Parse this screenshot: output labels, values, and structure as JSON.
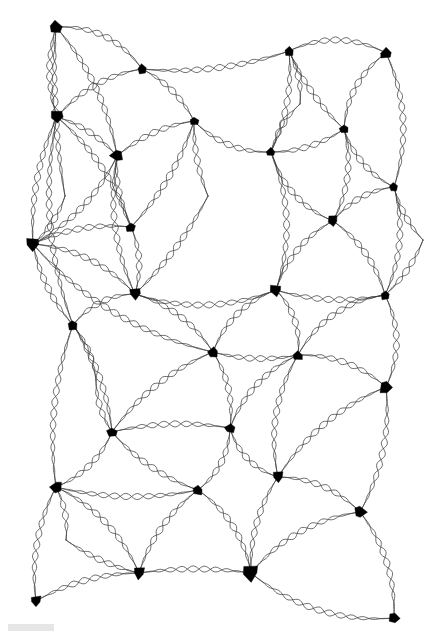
{
  "figure": {
    "background_color": "#ffffff",
    "width": 446,
    "height": 639,
    "edge_color": "#3c3c3c",
    "node_color": "#000000",
    "edge_stroke_width": 0.75,
    "edge_style": "braided-double-sinusoid",
    "braid_wavelength": 23,
    "braid_amplitude": 3.1,
    "node_count": 40,
    "edge_count": 82
  },
  "graph_data": {
    "type": "node-link-diagram",
    "layout": "planar-mesh",
    "nodes": [
      {
        "id": 0,
        "x": 56,
        "y": 27,
        "size": 9.5,
        "shape": "arrowhead-up",
        "degree": 3
      },
      {
        "id": 1,
        "x": 142,
        "y": 69,
        "size": 7.5,
        "shape": "diamond",
        "degree": 4
      },
      {
        "id": 2,
        "x": 289,
        "y": 51,
        "size": 7.0,
        "shape": "diamond",
        "degree": 4
      },
      {
        "id": 3,
        "x": 386,
        "y": 53,
        "size": 8.5,
        "shape": "arrowhead-up",
        "degree": 3
      },
      {
        "id": 4,
        "x": 57,
        "y": 117,
        "size": 9.0,
        "shape": "arrowhead-down",
        "degree": 6
      },
      {
        "id": 5,
        "x": 194,
        "y": 121,
        "size": 7.0,
        "shape": "diamond",
        "degree": 4
      },
      {
        "id": 6,
        "x": 344,
        "y": 129,
        "size": 7.5,
        "shape": "diamond",
        "degree": 4
      },
      {
        "id": 7,
        "x": 117,
        "y": 156,
        "size": 9.0,
        "shape": "arrowhead-left",
        "degree": 5
      },
      {
        "id": 8,
        "x": 271,
        "y": 152,
        "size": 7.0,
        "shape": "diamond",
        "degree": 4
      },
      {
        "id": 9,
        "x": 394,
        "y": 187,
        "size": 7.0,
        "shape": "diamond",
        "degree": 4
      },
      {
        "id": 10,
        "x": 131,
        "y": 227,
        "size": 7.5,
        "shape": "diamond",
        "degree": 4
      },
      {
        "id": 11,
        "x": 333,
        "y": 221,
        "size": 8.0,
        "shape": "arrowhead-down",
        "degree": 4
      },
      {
        "id": 12,
        "x": 33,
        "y": 244,
        "size": 10.0,
        "shape": "arrowhead-down",
        "degree": 7
      },
      {
        "id": 13,
        "x": 135,
        "y": 294,
        "size": 8.5,
        "shape": "arrowhead-down",
        "degree": 5
      },
      {
        "id": 14,
        "x": 276,
        "y": 290,
        "size": 8.5,
        "shape": "arrowhead-down",
        "degree": 5
      },
      {
        "id": 15,
        "x": 385,
        "y": 295,
        "size": 7.5,
        "shape": "diamond",
        "degree": 4
      },
      {
        "id": 16,
        "x": 73,
        "y": 325,
        "size": 8.0,
        "shape": "diamond",
        "degree": 4
      },
      {
        "id": 17,
        "x": 213,
        "y": 352,
        "size": 8.0,
        "shape": "diamond",
        "degree": 5
      },
      {
        "id": 18,
        "x": 298,
        "y": 355,
        "size": 8.0,
        "shape": "diamond",
        "degree": 5
      },
      {
        "id": 19,
        "x": 386,
        "y": 387,
        "size": 9.5,
        "shape": "arrowhead-right",
        "degree": 4
      },
      {
        "id": 20,
        "x": 112,
        "y": 432,
        "size": 8.0,
        "shape": "diamond",
        "degree": 5
      },
      {
        "id": 21,
        "x": 230,
        "y": 428,
        "size": 8.0,
        "shape": "diamond",
        "degree": 5
      },
      {
        "id": 22,
        "x": 56,
        "y": 487,
        "size": 8.5,
        "shape": "arrowhead-left",
        "degree": 5
      },
      {
        "id": 23,
        "x": 198,
        "y": 490,
        "size": 8.0,
        "shape": "diamond",
        "degree": 5
      },
      {
        "id": 24,
        "x": 278,
        "y": 477,
        "size": 8.5,
        "shape": "arrowhead-down",
        "degree": 4
      },
      {
        "id": 25,
        "x": 360,
        "y": 512,
        "size": 9.0,
        "shape": "arrowhead-right",
        "degree": 5
      },
      {
        "id": 26,
        "x": 139,
        "y": 573,
        "size": 9.0,
        "shape": "arrowhead-down",
        "degree": 6
      },
      {
        "id": 27,
        "x": 251,
        "y": 573,
        "size": 11.5,
        "shape": "arrowhead-down",
        "degree": 4
      },
      {
        "id": 28,
        "x": 36,
        "y": 601,
        "size": 8.0,
        "shape": "arrowhead-down",
        "degree": 4
      },
      {
        "id": 29,
        "x": 394,
        "y": 618,
        "size": 8.0,
        "shape": "arrowhead-right",
        "degree": 2
      },
      {
        "id": 30,
        "x": 208,
        "y": 196,
        "size": 0.0,
        "shape": "crossing",
        "degree": 0
      },
      {
        "id": 31,
        "x": 65,
        "y": 196,
        "size": 0.0,
        "shape": "crossing",
        "degree": 0
      },
      {
        "id": 32,
        "x": 355,
        "y": 455,
        "size": 0.0,
        "shape": "crossing",
        "degree": 0
      },
      {
        "id": 33,
        "x": 66,
        "y": 540,
        "size": 0.0,
        "shape": "crossing",
        "degree": 0
      },
      {
        "id": 34,
        "x": 300,
        "y": 104,
        "size": 0.0,
        "shape": "crossing",
        "degree": 0
      },
      {
        "id": 35,
        "x": 180,
        "y": 268,
        "size": 0.0,
        "shape": "crossing",
        "degree": 0
      },
      {
        "id": 36,
        "x": 423,
        "y": 240,
        "size": 0.0,
        "shape": "crossing",
        "degree": 0
      },
      {
        "id": 37,
        "x": 155,
        "y": 500,
        "size": 0.0,
        "shape": "crossing",
        "degree": 0
      },
      {
        "id": 38,
        "x": 249,
        "y": 250,
        "size": 0.0,
        "shape": "crossing",
        "degree": 0
      },
      {
        "id": 39,
        "x": 96,
        "y": 380,
        "size": 0.0,
        "shape": "crossing",
        "degree": 0
      }
    ],
    "edges": [
      {
        "s": 0,
        "t": 1,
        "bow": -26
      },
      {
        "s": 0,
        "t": 4,
        "bow": 14
      },
      {
        "s": 0,
        "t": 7,
        "bow": -20
      },
      {
        "s": 1,
        "t": 2,
        "bow": 16
      },
      {
        "s": 1,
        "t": 4,
        "bow": 18
      },
      {
        "s": 1,
        "t": 5,
        "bow": -12
      },
      {
        "s": 2,
        "t": 3,
        "bow": -24
      },
      {
        "s": 2,
        "t": 6,
        "bow": 10
      },
      {
        "s": 2,
        "t": 8,
        "bow": -14
      },
      {
        "s": 3,
        "t": 6,
        "bow": 20
      },
      {
        "s": 3,
        "t": 9,
        "bow": -26
      },
      {
        "s": 4,
        "t": 7,
        "bow": -10
      },
      {
        "s": 4,
        "t": 12,
        "bow": 16
      },
      {
        "s": 4,
        "t": 10,
        "bow": -18
      },
      {
        "s": 4,
        "t": 16,
        "bow": 30
      },
      {
        "s": 5,
        "t": 8,
        "bow": 18
      },
      {
        "s": 5,
        "t": 7,
        "bow": 12
      },
      {
        "s": 5,
        "t": 10,
        "bow": -14
      },
      {
        "s": 6,
        "t": 8,
        "bow": -12
      },
      {
        "s": 6,
        "t": 9,
        "bow": 16
      },
      {
        "s": 6,
        "t": 11,
        "bow": -18
      },
      {
        "s": 7,
        "t": 10,
        "bow": 10
      },
      {
        "s": 7,
        "t": 12,
        "bow": -20
      },
      {
        "s": 7,
        "t": 13,
        "bow": 22
      },
      {
        "s": 8,
        "t": 11,
        "bow": 22
      },
      {
        "s": 8,
        "t": 14,
        "bow": -26
      },
      {
        "s": 9,
        "t": 11,
        "bow": 14
      },
      {
        "s": 9,
        "t": 15,
        "bow": -20
      },
      {
        "s": 10,
        "t": 12,
        "bow": 14
      },
      {
        "s": 10,
        "t": 13,
        "bow": -12
      },
      {
        "s": 11,
        "t": 14,
        "bow": 18
      },
      {
        "s": 11,
        "t": 15,
        "bow": -16
      },
      {
        "s": 12,
        "t": 13,
        "bow": -22
      },
      {
        "s": 12,
        "t": 16,
        "bow": 12
      },
      {
        "s": 12,
        "t": 17,
        "bow": 34
      },
      {
        "s": 13,
        "t": 16,
        "bow": 16
      },
      {
        "s": 13,
        "t": 17,
        "bow": -18
      },
      {
        "s": 13,
        "t": 14,
        "bow": 26
      },
      {
        "s": 14,
        "t": 17,
        "bow": 20
      },
      {
        "s": 14,
        "t": 18,
        "bow": -16
      },
      {
        "s": 14,
        "t": 15,
        "bow": 14
      },
      {
        "s": 15,
        "t": 19,
        "bow": -22
      },
      {
        "s": 15,
        "t": 18,
        "bow": 26
      },
      {
        "s": 16,
        "t": 20,
        "bow": -14
      },
      {
        "s": 16,
        "t": 22,
        "bow": 20
      },
      {
        "s": 17,
        "t": 20,
        "bow": 18
      },
      {
        "s": 17,
        "t": 21,
        "bow": -14
      },
      {
        "s": 17,
        "t": 18,
        "bow": 10
      },
      {
        "s": 18,
        "t": 21,
        "bow": 20
      },
      {
        "s": 18,
        "t": 19,
        "bow": -18
      },
      {
        "s": 18,
        "t": 24,
        "bow": 24
      },
      {
        "s": 19,
        "t": 25,
        "bow": -20
      },
      {
        "s": 19,
        "t": 24,
        "bow": 22
      },
      {
        "s": 20,
        "t": 22,
        "bow": -16
      },
      {
        "s": 20,
        "t": 23,
        "bow": 14
      },
      {
        "s": 20,
        "t": 21,
        "bow": -12
      },
      {
        "s": 21,
        "t": 23,
        "bow": -16
      },
      {
        "s": 21,
        "t": 24,
        "bow": 18
      },
      {
        "s": 22,
        "t": 23,
        "bow": 16
      },
      {
        "s": 22,
        "t": 26,
        "bow": -22
      },
      {
        "s": 22,
        "t": 28,
        "bow": 18
      },
      {
        "s": 23,
        "t": 26,
        "bow": 16
      },
      {
        "s": 23,
        "t": 27,
        "bow": -20
      },
      {
        "s": 24,
        "t": 25,
        "bow": -18
      },
      {
        "s": 24,
        "t": 27,
        "bow": 16
      },
      {
        "s": 25,
        "t": 27,
        "bow": 24
      },
      {
        "s": 25,
        "t": 29,
        "bow": -20
      },
      {
        "s": 26,
        "t": 27,
        "bow": -8
      },
      {
        "s": 26,
        "t": 28,
        "bow": 14
      },
      {
        "s": 27,
        "t": 29,
        "bow": 30
      },
      {
        "s": 0,
        "t": 31,
        "bow": 10
      },
      {
        "s": 31,
        "t": 12,
        "bow": -8
      },
      {
        "s": 5,
        "t": 30,
        "bow": 8
      },
      {
        "s": 30,
        "t": 13,
        "bow": -10
      },
      {
        "s": 2,
        "t": 34,
        "bow": -8
      },
      {
        "s": 34,
        "t": 8,
        "bow": 8
      },
      {
        "s": 9,
        "t": 36,
        "bow": 8
      },
      {
        "s": 36,
        "t": 15,
        "bow": -8
      },
      {
        "s": 16,
        "t": 39,
        "bow": -8
      },
      {
        "s": 39,
        "t": 20,
        "bow": 8
      },
      {
        "s": 22,
        "t": 33,
        "bow": -8
      },
      {
        "s": 33,
        "t": 26,
        "bow": 8
      }
    ]
  },
  "artifacts": {
    "smudge": {
      "x": 8,
      "y": 624,
      "width": 46,
      "height": 7,
      "color": "#d8d8d8"
    }
  }
}
